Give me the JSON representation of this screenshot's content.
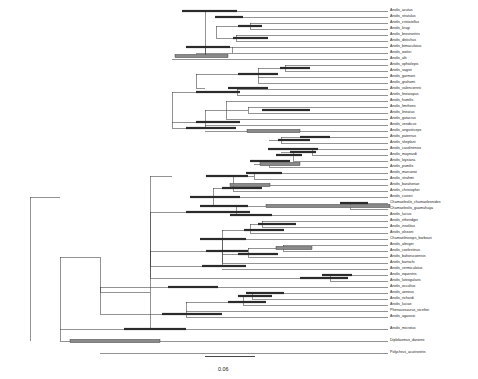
{
  "figure": {
    "type": "phylogenetic-tree",
    "title": "",
    "background_color": "#ffffff",
    "branch_color": "#3a3a3a",
    "bar_dark_color": "#2b2b2b",
    "bar_gray_color": "#8a8a8a",
    "label_color": "#1a1a1a"
  },
  "scale_bar": {
    "label": "0.06",
    "x_start": 205,
    "x_end": 255,
    "y": 356,
    "label_x": 218,
    "label_y": 366
  },
  "chart_data": {
    "type": "tree",
    "title": "",
    "xlabel": "",
    "ylabel": "",
    "scale_bar_value": 0.06,
    "scale_bar_pixels": 50,
    "tip_count": 56,
    "node_bar_types": [
      "dark",
      "gray"
    ],
    "taxa": [
      {
        "name": "Anolis_acutus",
        "y": 11,
        "branch_x0": 205,
        "branch_x1": 388
      },
      {
        "name": "Anolis_stratulus",
        "y": 17,
        "branch_x0": 216,
        "branch_x1": 388
      },
      {
        "name": "Anolis_cristatellus",
        "y": 23,
        "branch_x0": 250,
        "branch_x1": 388
      },
      {
        "name": "Anolis_krugi",
        "y": 29,
        "branch_x0": 250,
        "branch_x1": 388
      },
      {
        "name": "Anolis_brevirostris",
        "y": 35,
        "branch_x0": 236,
        "branch_x1": 388
      },
      {
        "name": "Anolis_distichus",
        "y": 41,
        "branch_x0": 236,
        "branch_x1": 388
      },
      {
        "name": "Anolis_bimaculatus",
        "y": 47,
        "branch_x0": 232,
        "branch_x1": 388
      },
      {
        "name": "Anolis_wattsi",
        "y": 53,
        "branch_x0": 196,
        "branch_x1": 388
      },
      {
        "name": "Anolis_alti",
        "y": 59,
        "branch_x0": 172,
        "branch_x1": 388
      },
      {
        "name": "Anolis_ophiolepis",
        "y": 65,
        "branch_x0": 285,
        "branch_x1": 388
      },
      {
        "name": "Anolis_sagrei",
        "y": 71,
        "branch_x0": 285,
        "branch_x1": 388
      },
      {
        "name": "Anolis_garmani",
        "y": 77,
        "branch_x0": 258,
        "branch_x1": 388
      },
      {
        "name": "Anolis_grahami",
        "y": 83,
        "branch_x0": 258,
        "branch_x1": 388
      },
      {
        "name": "Anolis_valenciennii",
        "y": 89,
        "branch_x0": 237,
        "branch_x1": 388
      },
      {
        "name": "Anolis_lineatopus",
        "y": 95,
        "branch_x0": 237,
        "branch_x1": 388
      },
      {
        "name": "Anolis_humilis",
        "y": 101,
        "branch_x0": 226,
        "branch_x1": 388
      },
      {
        "name": "Anolis_limifrons",
        "y": 107,
        "branch_x0": 248,
        "branch_x1": 388
      },
      {
        "name": "Anolis_lineatus",
        "y": 113,
        "branch_x0": 248,
        "branch_x1": 388
      },
      {
        "name": "Anolis_gutacrus",
        "y": 119,
        "branch_x0": 226,
        "branch_x1": 388
      },
      {
        "name": "Anolis_vendicus",
        "y": 125,
        "branch_x0": 205,
        "branch_x1": 388
      },
      {
        "name": "Anolis_angusticeps",
        "y": 131,
        "branch_x0": 205,
        "branch_x1": 388
      },
      {
        "name": "Anolis_paternus",
        "y": 137,
        "branch_x0": 281,
        "branch_x1": 388
      },
      {
        "name": "Anolis_sheplani",
        "y": 143,
        "branch_x0": 281,
        "branch_x1": 388
      },
      {
        "name": "Anolis_carolinensis",
        "y": 149,
        "branch_x0": 312,
        "branch_x1": 388
      },
      {
        "name": "Anolis_maynardi",
        "y": 155,
        "branch_x0": 312,
        "branch_x1": 388
      },
      {
        "name": "Anolis_loysiana",
        "y": 161,
        "branch_x0": 293,
        "branch_x1": 388
      },
      {
        "name": "Anolis_pumilis",
        "y": 167,
        "branch_x0": 269,
        "branch_x1": 388
      },
      {
        "name": "Anolis_marcanoi",
        "y": 173,
        "branch_x0": 254,
        "branch_x1": 388
      },
      {
        "name": "Anolis_strahmi",
        "y": 179,
        "branch_x0": 254,
        "branch_x1": 388
      },
      {
        "name": "Anolis_barahonae",
        "y": 185,
        "branch_x0": 233,
        "branch_x1": 388
      },
      {
        "name": "Anolis_christophei",
        "y": 191,
        "branch_x0": 233,
        "branch_x1": 388
      },
      {
        "name": "Anolis_cuvieri",
        "y": 197,
        "branch_x0": 213,
        "branch_x1": 388
      },
      {
        "name": "Chamaeleolis_chamaeleonides",
        "y": 203,
        "branch_x0": 350,
        "branch_x1": 388
      },
      {
        "name": "Chamaeleolis_guamuhaya",
        "y": 209,
        "branch_x0": 350,
        "branch_x1": 388
      },
      {
        "name": "Anolis_lucius",
        "y": 215,
        "branch_x0": 236,
        "branch_x1": 388
      },
      {
        "name": "Anolis_etheridgei",
        "y": 221,
        "branch_x0": 262,
        "branch_x1": 388
      },
      {
        "name": "Anolis_insolitus",
        "y": 227,
        "branch_x0": 262,
        "branch_x1": 388
      },
      {
        "name": "Anolis_olssoni",
        "y": 233,
        "branch_x0": 250,
        "branch_x1": 388
      },
      {
        "name": "Chamaelinorops_barbouri",
        "y": 239,
        "branch_x0": 222,
        "branch_x1": 388
      },
      {
        "name": "Anolis_aliniger",
        "y": 245,
        "branch_x0": 283,
        "branch_x1": 388
      },
      {
        "name": "Anolis_coelestinus",
        "y": 251,
        "branch_x0": 283,
        "branch_x1": 388
      },
      {
        "name": "Anolis_bahorucoensis",
        "y": 257,
        "branch_x0": 248,
        "branch_x1": 388
      },
      {
        "name": "Anolis_bartschi",
        "y": 263,
        "branch_x0": 222,
        "branch_x1": 388
      },
      {
        "name": "Anolis_vermiculatus",
        "y": 269,
        "branch_x0": 222,
        "branch_x1": 388
      },
      {
        "name": "Anolis_equestris",
        "y": 275,
        "branch_x0": 330,
        "branch_x1": 388
      },
      {
        "name": "Anolis_luteogularis",
        "y": 281,
        "branch_x0": 330,
        "branch_x1": 388
      },
      {
        "name": "Anolis_occultus",
        "y": 287,
        "branch_x0": 193,
        "branch_x1": 388
      },
      {
        "name": "Anolis_aeneus",
        "y": 293,
        "branch_x0": 252,
        "branch_x1": 388
      },
      {
        "name": "Anolis_richardi",
        "y": 299,
        "branch_x0": 252,
        "branch_x1": 388
      },
      {
        "name": "Anolis_luciae",
        "y": 305,
        "branch_x0": 243,
        "branch_x1": 388
      },
      {
        "name": "Phenacosaurus_nicefori",
        "y": 311,
        "branch_x0": 186,
        "branch_x1": 388
      },
      {
        "name": "Anolis_agassizi",
        "y": 317,
        "branch_x0": 186,
        "branch_x1": 388
      },
      {
        "name": "Anolis_microtus",
        "y": 329,
        "branch_x0": 150,
        "branch_x1": 388
      },
      {
        "name": "Diplolaemus_darwinii",
        "y": 341,
        "branch_x0": 60,
        "branch_x1": 388
      },
      {
        "name": "Polychrus_acutirostris",
        "y": 353,
        "branch_x0": 100,
        "branch_x1": 388
      }
    ],
    "internal_branches": [
      {
        "x0": 30,
        "x1": 60,
        "y": 197
      },
      {
        "x0": 60,
        "x1": 100,
        "y": 257
      },
      {
        "x0": 100,
        "x1": 150,
        "y": 292
      },
      {
        "x0": 150,
        "x1": 172,
        "y": 176
      },
      {
        "x0": 172,
        "x1": 196,
        "y": 122
      },
      {
        "x0": 196,
        "x1": 205,
        "y": 88
      },
      {
        "x0": 205,
        "x1": 216,
        "y": 56
      },
      {
        "x0": 216,
        "x1": 250,
        "y": 26
      },
      {
        "x0": 216,
        "x1": 236,
        "y": 38
      },
      {
        "x0": 205,
        "x1": 232,
        "y": 47
      },
      {
        "x0": 196,
        "x1": 258,
        "y": 74
      },
      {
        "x0": 258,
        "x1": 285,
        "y": 68
      },
      {
        "x0": 172,
        "x1": 237,
        "y": 92
      },
      {
        "x0": 172,
        "x1": 205,
        "y": 128
      },
      {
        "x0": 205,
        "x1": 226,
        "y": 110
      },
      {
        "x0": 226,
        "x1": 248,
        "y": 110
      },
      {
        "x0": 150,
        "x1": 213,
        "y": 212
      },
      {
        "x0": 213,
        "x1": 233,
        "y": 188
      },
      {
        "x0": 233,
        "x1": 254,
        "y": 176
      },
      {
        "x0": 254,
        "x1": 269,
        "y": 164
      },
      {
        "x0": 269,
        "x1": 281,
        "y": 140
      },
      {
        "x0": 281,
        "x1": 293,
        "y": 152
      },
      {
        "x0": 293,
        "x1": 312,
        "y": 152
      },
      {
        "x0": 213,
        "x1": 236,
        "y": 206
      },
      {
        "x0": 236,
        "x1": 350,
        "y": 206
      },
      {
        "x0": 150,
        "x1": 222,
        "y": 251
      },
      {
        "x0": 222,
        "x1": 250,
        "y": 230
      },
      {
        "x0": 250,
        "x1": 262,
        "y": 224
      },
      {
        "x0": 222,
        "x1": 248,
        "y": 254
      },
      {
        "x0": 248,
        "x1": 283,
        "y": 248
      },
      {
        "x0": 100,
        "x1": 193,
        "y": 287
      },
      {
        "x0": 150,
        "x1": 222,
        "y": 266
      },
      {
        "x0": 150,
        "x1": 330,
        "y": 278
      },
      {
        "x0": 100,
        "x1": 186,
        "y": 314
      },
      {
        "x0": 186,
        "x1": 243,
        "y": 302
      },
      {
        "x0": 243,
        "x1": 252,
        "y": 296
      },
      {
        "x0": 60,
        "x1": 150,
        "y": 329
      }
    ],
    "node_bars": [
      {
        "x0": 182,
        "x1": 237,
        "y": 11,
        "style": "dark"
      },
      {
        "x0": 215,
        "x1": 243,
        "y": 17,
        "style": "dark"
      },
      {
        "x0": 238,
        "x1": 262,
        "y": 26,
        "style": "dark"
      },
      {
        "x0": 233,
        "x1": 268,
        "y": 38,
        "style": "dark"
      },
      {
        "x0": 186,
        "x1": 230,
        "y": 47,
        "style": "dark"
      },
      {
        "x0": 175,
        "x1": 228,
        "y": 56,
        "style": "gray"
      },
      {
        "x0": 280,
        "x1": 310,
        "y": 68,
        "style": "dark"
      },
      {
        "x0": 238,
        "x1": 278,
        "y": 74,
        "style": "dark"
      },
      {
        "x0": 228,
        "x1": 268,
        "y": 88,
        "style": "dark"
      },
      {
        "x0": 196,
        "x1": 240,
        "y": 92,
        "style": "dark"
      },
      {
        "x0": 262,
        "x1": 310,
        "y": 110,
        "style": "dark"
      },
      {
        "x0": 196,
        "x1": 240,
        "y": 122,
        "style": "dark"
      },
      {
        "x0": 186,
        "x1": 236,
        "y": 128,
        "style": "dark"
      },
      {
        "x0": 247,
        "x1": 300,
        "y": 131,
        "style": "gray"
      },
      {
        "x0": 300,
        "x1": 330,
        "y": 137,
        "style": "dark"
      },
      {
        "x0": 278,
        "x1": 310,
        "y": 140,
        "style": "dark"
      },
      {
        "x0": 268,
        "x1": 318,
        "y": 149,
        "style": "dark"
      },
      {
        "x0": 290,
        "x1": 316,
        "y": 152,
        "style": "dark"
      },
      {
        "x0": 276,
        "x1": 302,
        "y": 155,
        "style": "dark"
      },
      {
        "x0": 250,
        "x1": 290,
        "y": 161,
        "style": "dark"
      },
      {
        "x0": 260,
        "x1": 300,
        "y": 164,
        "style": "gray"
      },
      {
        "x0": 246,
        "x1": 282,
        "y": 173,
        "style": "dark"
      },
      {
        "x0": 206,
        "x1": 248,
        "y": 176,
        "style": "dark"
      },
      {
        "x0": 230,
        "x1": 270,
        "y": 185,
        "style": "gray"
      },
      {
        "x0": 222,
        "x1": 262,
        "y": 188,
        "style": "dark"
      },
      {
        "x0": 190,
        "x1": 240,
        "y": 197,
        "style": "dark"
      },
      {
        "x0": 200,
        "x1": 248,
        "y": 206,
        "style": "dark"
      },
      {
        "x0": 266,
        "x1": 390,
        "y": 206,
        "style": "gray"
      },
      {
        "x0": 340,
        "x1": 368,
        "y": 203,
        "style": "dark"
      },
      {
        "x0": 186,
        "x1": 250,
        "y": 212,
        "style": "dark"
      },
      {
        "x0": 230,
        "x1": 272,
        "y": 215,
        "style": "dark"
      },
      {
        "x0": 258,
        "x1": 296,
        "y": 224,
        "style": "dark"
      },
      {
        "x0": 244,
        "x1": 284,
        "y": 230,
        "style": "dark"
      },
      {
        "x0": 200,
        "x1": 246,
        "y": 239,
        "style": "dark"
      },
      {
        "x0": 276,
        "x1": 312,
        "y": 248,
        "style": "gray"
      },
      {
        "x0": 238,
        "x1": 278,
        "y": 254,
        "style": "dark"
      },
      {
        "x0": 206,
        "x1": 248,
        "y": 251,
        "style": "dark"
      },
      {
        "x0": 202,
        "x1": 246,
        "y": 266,
        "style": "dark"
      },
      {
        "x0": 322,
        "x1": 352,
        "y": 275,
        "style": "dark"
      },
      {
        "x0": 300,
        "x1": 348,
        "y": 278,
        "style": "dark"
      },
      {
        "x0": 168,
        "x1": 218,
        "y": 287,
        "style": "dark"
      },
      {
        "x0": 246,
        "x1": 284,
        "y": 293,
        "style": "dark"
      },
      {
        "x0": 238,
        "x1": 272,
        "y": 296,
        "style": "dark"
      },
      {
        "x0": 228,
        "x1": 266,
        "y": 302,
        "style": "dark"
      },
      {
        "x0": 162,
        "x1": 222,
        "y": 314,
        "style": "dark"
      },
      {
        "x0": 124,
        "x1": 186,
        "y": 329,
        "style": "dark"
      },
      {
        "x0": 70,
        "x1": 160,
        "y": 341,
        "style": "gray"
      }
    ],
    "vertical_connectors": [
      {
        "x": 30,
        "y0": 197,
        "y1": 341
      },
      {
        "x": 60,
        "y0": 257,
        "y1": 341
      },
      {
        "x": 100,
        "y0": 287,
        "y1": 314
      },
      {
        "x": 100,
        "y0": 257,
        "y1": 292
      },
      {
        "x": 150,
        "y0": 176,
        "y1": 329
      },
      {
        "x": 150,
        "y0": 212,
        "y1": 278
      },
      {
        "x": 172,
        "y0": 92,
        "y1": 128
      },
      {
        "x": 196,
        "y0": 74,
        "y1": 88
      },
      {
        "x": 205,
        "y0": 47,
        "y1": 56
      },
      {
        "x": 205,
        "y0": 110,
        "y1": 128
      },
      {
        "x": 216,
        "y0": 26,
        "y1": 38
      },
      {
        "x": 213,
        "y0": 188,
        "y1": 206
      },
      {
        "x": 222,
        "y0": 230,
        "y1": 266
      },
      {
        "x": 226,
        "y0": 101,
        "y1": 119
      },
      {
        "x": 232,
        "y0": 47,
        "y1": 53
      },
      {
        "x": 233,
        "y0": 176,
        "y1": 191
      },
      {
        "x": 236,
        "y0": 35,
        "y1": 41
      },
      {
        "x": 236,
        "y0": 206,
        "y1": 215
      },
      {
        "x": 237,
        "y0": 89,
        "y1": 95
      },
      {
        "x": 243,
        "y0": 296,
        "y1": 305
      },
      {
        "x": 248,
        "y0": 107,
        "y1": 113
      },
      {
        "x": 248,
        "y0": 248,
        "y1": 257
      },
      {
        "x": 250,
        "y0": 23,
        "y1": 29
      },
      {
        "x": 250,
        "y0": 224,
        "y1": 233
      },
      {
        "x": 252,
        "y0": 293,
        "y1": 299
      },
      {
        "x": 254,
        "y0": 173,
        "y1": 179
      },
      {
        "x": 258,
        "y0": 68,
        "y1": 83
      },
      {
        "x": 262,
        "y0": 221,
        "y1": 227
      },
      {
        "x": 269,
        "y0": 164,
        "y1": 167
      },
      {
        "x": 281,
        "y0": 137,
        "y1": 143
      },
      {
        "x": 283,
        "y0": 245,
        "y1": 251
      },
      {
        "x": 285,
        "y0": 65,
        "y1": 71
      },
      {
        "x": 293,
        "y0": 152,
        "y1": 161
      },
      {
        "x": 312,
        "y0": 149,
        "y1": 155
      },
      {
        "x": 330,
        "y0": 275,
        "y1": 281
      },
      {
        "x": 350,
        "y0": 203,
        "y1": 209
      },
      {
        "x": 186,
        "y0": 302,
        "y1": 317
      },
      {
        "x": 205,
        "y0": 11,
        "y1": 56
      },
      {
        "x": 222,
        "y0": 239,
        "y1": 263
      },
      {
        "x": 150,
        "y0": 251,
        "y1": 266
      }
    ]
  }
}
